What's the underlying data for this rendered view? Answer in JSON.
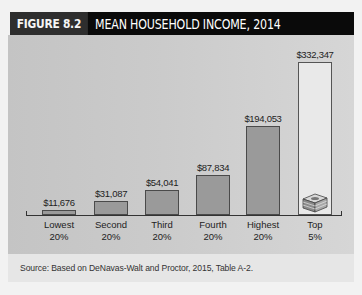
{
  "figure": {
    "label": "FIGURE 8.2",
    "title": "MEAN HOUSEHOLD INCOME, 2014",
    "source": "Source: Based on DeNavas-Walt and Proctor, 2015, Table A-2."
  },
  "colors": {
    "title_bg": "#0a0a0a",
    "label_bg": "#2e2e2e",
    "bar_fill": "#9a9a9a",
    "top_bar_fill": "#e9e9e9",
    "panel_bg": "#c8c8c8"
  },
  "bars": [
    {
      "value_label": "$11,676",
      "cat1": "Lowest",
      "cat2": "20%"
    },
    {
      "value_label": "$31,087",
      "cat1": "Second",
      "cat2": "20%"
    },
    {
      "value_label": "$54,041",
      "cat1": "Third",
      "cat2": "20%"
    },
    {
      "value_label": "$87,834",
      "cat1": "Fourth",
      "cat2": "20%"
    },
    {
      "value_label": "$194,053",
      "cat1": "Highest",
      "cat2": "20%"
    },
    {
      "value_label": "$332,347",
      "cat1": "Top",
      "cat2": "5%"
    }
  ],
  "icons": {
    "top_bar_icon": "money-stack-icon"
  },
  "chart_data": {
    "type": "bar",
    "title": "FIGURE 8.2 MEAN HOUSEHOLD INCOME, 2014",
    "categories": [
      "Lowest 20%",
      "Second 20%",
      "Third 20%",
      "Fourth 20%",
      "Highest 20%",
      "Top 5%"
    ],
    "values": [
      11676,
      31087,
      54041,
      87834,
      194053,
      332347
    ],
    "value_labels": [
      "$11,676",
      "$31,087",
      "$54,041",
      "$87,834",
      "$194,053",
      "$332,347"
    ],
    "xlabel": "",
    "ylabel": "",
    "ylim": [
      0,
      332347
    ],
    "grid": false,
    "legend": null,
    "annotations": [
      "Top 5% bar contains an illustration of a stack of money"
    ],
    "source": "Source: Based on DeNavas-Walt and Proctor, 2015, Table A-2."
  }
}
